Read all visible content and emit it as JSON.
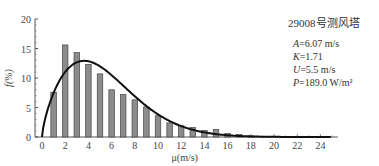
{
  "chart_data": {
    "type": "bar",
    "title": "29008号测风塔",
    "xlabel": "μ(m/s)",
    "ylabel": "f(%)",
    "xlim": [
      0,
      25
    ],
    "ylim": [
      0,
      20
    ],
    "x_ticks": [
      "0",
      "2",
      "4",
      "6",
      "8",
      "10",
      "12",
      "14",
      "16",
      "18",
      "20",
      "22",
      "24"
    ],
    "y_ticks": [
      "0",
      "5",
      "10",
      "15",
      "20"
    ],
    "grid": false,
    "series": [
      {
        "name": "Measured frequency",
        "type": "bar",
        "x": [
          1,
          2,
          3,
          4,
          5,
          6,
          7,
          8,
          9,
          10,
          11,
          12,
          13,
          14,
          15,
          16,
          17,
          18
        ],
        "values": [
          7.6,
          15.6,
          14.3,
          12.3,
          10.7,
          8.0,
          7.2,
          6.3,
          5.1,
          3.6,
          2.4,
          1.9,
          1.6,
          1.1,
          1.3,
          0.6,
          0.4,
          0.2
        ]
      },
      {
        "name": "Weibull fit",
        "type": "line",
        "params": {
          "A": 6.07,
          "K": 1.71
        }
      }
    ],
    "annotations": [
      {
        "label": "A",
        "text": "=6.07 m/s"
      },
      {
        "label": "K",
        "text": "=1.71"
      },
      {
        "label": "U",
        "text": "=5.5 m/s"
      },
      {
        "label": "P",
        "text": "=189.0 W/m²"
      }
    ],
    "colors": {
      "bar_fill": "#8c8c8c",
      "bar_edge": "#444444",
      "curve": "#111111",
      "axis": "#555555"
    }
  }
}
